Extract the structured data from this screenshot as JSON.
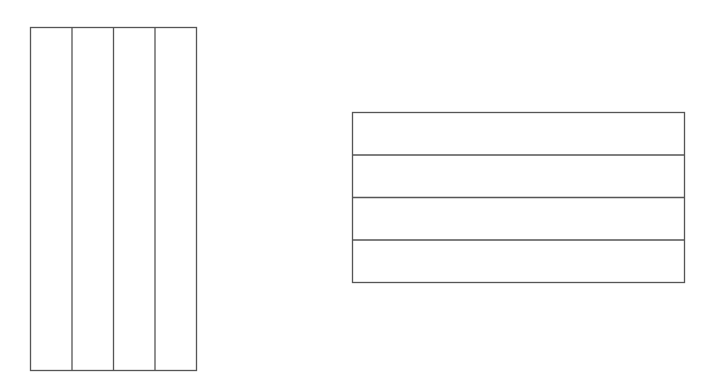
{
  "canvas": {
    "width": 714,
    "height": 380,
    "background": "#ffffff"
  },
  "style": {
    "stroke": "#555555",
    "stroke_width": 1.3
  },
  "shapes": [
    {
      "id": "vertical-partition",
      "description": "Rectangle divided into 4 equal vertical strips",
      "x": 30.5,
      "y": 27.5,
      "width": 166,
      "height": 343,
      "orientation": "vertical",
      "parts": 4
    },
    {
      "id": "horizontal-partition",
      "description": "Rectangle divided into 4 equal horizontal strips",
      "x": 352.5,
      "y": 112.5,
      "width": 332,
      "height": 170,
      "orientation": "horizontal",
      "parts": 4
    }
  ]
}
